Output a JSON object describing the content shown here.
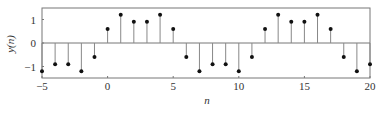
{
  "chart_data": {
    "type": "stem",
    "title": "",
    "xlabel": "n",
    "ylabel": "y(n)",
    "xlim": [
      -5,
      20
    ],
    "ylim": [
      -1.45,
      1.55
    ],
    "xticks": [
      -5,
      0,
      5,
      10,
      15,
      20
    ],
    "yticks": [
      -1,
      0,
      1
    ],
    "grid": false,
    "legend": null,
    "x": [
      -5,
      -4,
      -3,
      -2,
      -1,
      0,
      1,
      2,
      3,
      4,
      5,
      6,
      7,
      8,
      9,
      10,
      11,
      12,
      13,
      14,
      15,
      16,
      17,
      18,
      19,
      20
    ],
    "values": [
      -1.2,
      -0.9,
      -0.9,
      -1.2,
      -0.6,
      0.6,
      1.2,
      0.9,
      0.9,
      1.2,
      0.6,
      -0.6,
      -1.2,
      -0.9,
      -0.9,
      -1.2,
      -0.6,
      0.6,
      1.2,
      0.9,
      0.9,
      1.2,
      0.6,
      -0.6,
      -1.2,
      -0.9
    ]
  },
  "colors": {
    "stem": "#888888",
    "marker": "#111111",
    "frame": "#777777",
    "text": "#333333"
  }
}
